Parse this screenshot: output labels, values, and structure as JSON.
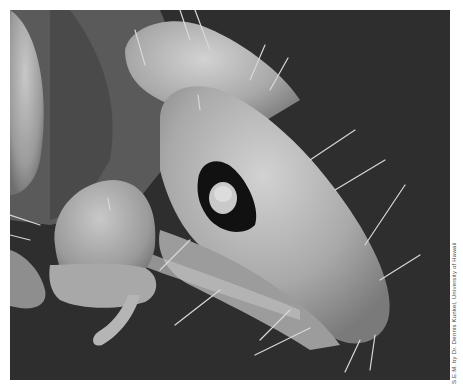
{
  "image": {
    "subject": "Scanning electron micrograph of insect head",
    "background_color": "#2e2e2e",
    "border_color": "#ffffff",
    "specimen_color": "#b8b8b8"
  },
  "credit": {
    "text": "S.E.M. by Dr. Dennis Kunkel, University of Hawaii"
  }
}
